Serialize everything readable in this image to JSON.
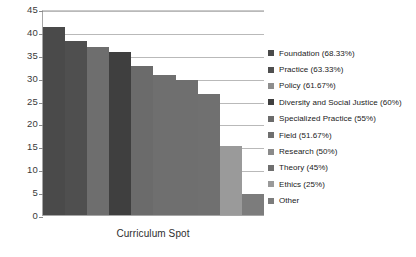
{
  "chart_data": {
    "type": "bar",
    "title": "",
    "xlabel": "Curriculum Spot",
    "ylabel": "",
    "ylim": [
      0,
      45
    ],
    "ytick_step": 5,
    "yticks": [
      "45",
      "40",
      "35",
      "30",
      "25",
      "20",
      "15",
      "10",
      "5",
      "0"
    ],
    "grid": true,
    "legend_position": "right",
    "categories": [
      "Foundation",
      "Practice",
      "Policy",
      "Diversity and Social Justice",
      "Specialized Practice",
      "Field",
      "Research",
      "Theory",
      "Ethics",
      "Other"
    ],
    "values": [
      41,
      38,
      36.8,
      35.6,
      32.6,
      30.5,
      29.5,
      26.5,
      15,
      4.5
    ],
    "percent_labels": [
      "(68.33%)",
      "(63.33%)",
      "(61.67%)",
      "(60%)",
      "(55%)",
      "(51.67%)",
      "(50%)",
      "(45%)",
      "(25%)",
      ""
    ],
    "bar_colors": [
      "#4a4a4a",
      "#4f4f4f",
      "#6e6e6e",
      "#3f3f3f",
      "#6b6b6b",
      "#6f6f6f",
      "#6f6f6f",
      "#707070",
      "#9a9a9a",
      "#7c7c7c"
    ]
  },
  "legend": {
    "items": [
      {
        "label": "Foundation (68.33%)",
        "color": "#4a4a4a"
      },
      {
        "label": "Practice (63.33%)",
        "color": "#4f4f4f"
      },
      {
        "label": "Policy (61.67%)",
        "color": "#8e8e8e"
      },
      {
        "label": "Diversity and Social Justice (60%)",
        "color": "#3f3f3f"
      },
      {
        "label": "Specialized Practice (55%)",
        "color": "#6b6b6b"
      },
      {
        "label": "Field (51.67%)",
        "color": "#6f6f6f"
      },
      {
        "label": "Research (50%)",
        "color": "#8a8a8a"
      },
      {
        "label": "Theory (45%)",
        "color": "#6f6f6f"
      },
      {
        "label": "Ethics (25%)",
        "color": "#9a9a9a"
      },
      {
        "label": "Other",
        "color": "#7c7c7c"
      }
    ]
  }
}
